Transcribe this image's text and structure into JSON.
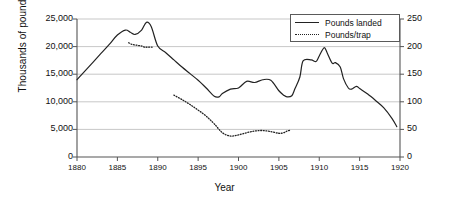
{
  "chart_data": {
    "type": "line",
    "title": "",
    "xlabel": "Year",
    "ylabel": "Thousands of pounds",
    "y2label": "",
    "xlim": [
      1880,
      1920
    ],
    "ylim": [
      0,
      25000
    ],
    "y2lim": [
      0,
      250
    ],
    "grid": true,
    "legend_position": "top-right",
    "xticks": [
      1880,
      1885,
      1890,
      1895,
      1900,
      1905,
      1910,
      1915,
      1920
    ],
    "xtick_labels": [
      "1880",
      "1885",
      "1890",
      "1895",
      "1900",
      "1905",
      "1910",
      "1915",
      "1920"
    ],
    "yticks": [
      0,
      5000,
      10000,
      15000,
      20000,
      25000
    ],
    "ytick_labels": [
      "0",
      "5,000",
      "10,000",
      "15,000",
      "20,000",
      "25,000"
    ],
    "y2ticks": [
      0,
      50,
      100,
      150,
      200,
      250
    ],
    "y2tick_labels": [
      "0",
      "50",
      "100",
      "150",
      "200",
      "250"
    ],
    "series": [
      {
        "name": "Pounds landed",
        "axis": "left",
        "style": "solid",
        "color": "#222222",
        "x": [
          1880,
          1881,
          1882,
          1883,
          1884,
          1885,
          1886,
          1886.6,
          1887.2,
          1888,
          1888.6,
          1889.2,
          1890,
          1891,
          1892,
          1893,
          1894,
          1895,
          1896,
          1897,
          1897.6,
          1898,
          1899,
          1900,
          1901,
          1902,
          1903,
          1904,
          1905,
          1905.6,
          1906,
          1906.6,
          1907,
          1907.6,
          1908,
          1909,
          1909.6,
          1910,
          1910.6,
          1911,
          1911.6,
          1912,
          1912.6,
          1913,
          1913.6,
          1914,
          1914.6,
          1915,
          1916,
          1917,
          1918,
          1919,
          1919.6
        ],
        "values": [
          14000,
          15600,
          17200,
          18800,
          20400,
          22100,
          23000,
          22600,
          22200,
          23000,
          24400,
          23600,
          20100,
          18900,
          17600,
          16300,
          15100,
          13900,
          12500,
          11000,
          10900,
          11500,
          12300,
          12500,
          13700,
          13500,
          14000,
          13900,
          12000,
          11200,
          10900,
          11100,
          12400,
          14500,
          17400,
          17600,
          17300,
          18300,
          19800,
          18800,
          17000,
          17100,
          16300,
          14200,
          12500,
          12300,
          12800,
          12400,
          11400,
          10200,
          8900,
          7000,
          5500
        ]
      },
      {
        "name": "Pounds/trap",
        "axis": "right",
        "style": "dotted",
        "color": "#222222",
        "segments": [
          {
            "x": [
              1886.4,
              1886.8,
              1887.2,
              1887.6,
              1888,
              1888.4,
              1888.8,
              1889.3
            ],
            "values": [
              207,
              204,
              203,
              202,
              201,
              199,
              199,
              199
            ]
          },
          {
            "x": [
              1892,
              1893,
              1894,
              1895,
              1896,
              1897,
              1898,
              1899,
              1900,
              1901,
              1902,
              1903,
              1904,
              1905,
              1905.6,
              1906,
              1906.5
            ],
            "values": [
              112,
              104,
              95,
              85,
              74,
              60,
              44,
              38,
              40,
              44,
              47,
              48,
              46,
              43,
              44,
              47,
              49
            ]
          }
        ]
      }
    ]
  },
  "legend": {
    "items": [
      {
        "label": "Pounds landed",
        "style": "solid"
      },
      {
        "label": "Pounds/trap",
        "style": "dotted"
      }
    ]
  }
}
